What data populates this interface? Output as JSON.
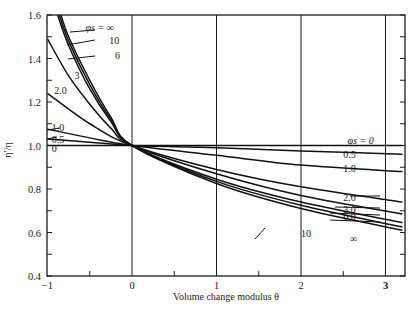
{
  "chart_data": {
    "type": "line",
    "title": "",
    "xlabel": "Volume change modulus θ",
    "ylabel": "η′/η",
    "xlim": [
      -1,
      3.24
    ],
    "ylim": [
      0.4,
      1.6
    ],
    "x_ticks": [
      -1,
      0,
      1,
      2,
      3
    ],
    "x_tick_labels": [
      "−1",
      "0",
      "1",
      "2",
      "3"
    ],
    "y_ticks": [
      0.4,
      0.6,
      0.8,
      1.0,
      1.2,
      1.4,
      1.6
    ],
    "y_tick_labels": [
      "0.4",
      "0.6",
      "0.8",
      "1.0",
      "1.2",
      "1.4",
      "1.6"
    ],
    "vertical_gridlines": [
      0,
      1,
      2,
      3
    ],
    "horizontal_gridlines": [
      1.0
    ],
    "legend_title": "φs",
    "series": [
      {
        "name": "0",
        "label": "0",
        "x": [
          -1,
          0,
          3.2
        ],
        "y": [
          1.0,
          1.0,
          1.0
        ]
      },
      {
        "name": "0.5",
        "label": "0.5",
        "x": [
          -1,
          -0.5,
          0,
          1,
          2,
          3.2
        ],
        "y": [
          1.03,
          1.015,
          1.0,
          0.99,
          0.975,
          0.96
        ]
      },
      {
        "name": "1.0",
        "label": "1.0",
        "x": [
          -1,
          -0.5,
          0,
          1,
          2,
          3.2
        ],
        "y": [
          1.075,
          1.035,
          1.0,
          0.955,
          0.91,
          0.88
        ]
      },
      {
        "name": "2.0",
        "label": "2.0",
        "x": [
          -1,
          -0.5,
          0,
          1,
          2,
          3.2
        ],
        "y": [
          1.24,
          1.1,
          1.0,
          0.89,
          0.81,
          0.74
        ]
      },
      {
        "name": "3.0",
        "label": "3",
        "x": [
          -1,
          -0.75,
          -0.5,
          -0.25,
          0,
          1,
          2,
          3.2
        ],
        "y": [
          1.49,
          1.32,
          1.19,
          1.08,
          1.0,
          0.87,
          0.77,
          0.685
        ]
      },
      {
        "name": "6.0",
        "label": "6",
        "x": [
          -0.88,
          -0.75,
          -0.5,
          -0.25,
          0,
          1,
          2,
          3.2
        ],
        "y": [
          1.6,
          1.46,
          1.26,
          1.11,
          1.0,
          0.845,
          0.74,
          0.645
        ]
      },
      {
        "name": "10",
        "label": "10",
        "x": [
          -0.86,
          -0.75,
          -0.5,
          -0.25,
          0,
          1,
          2,
          3.2
        ],
        "y": [
          1.6,
          1.48,
          1.28,
          1.12,
          1.0,
          0.835,
          0.725,
          0.625
        ]
      },
      {
        "name": "∞",
        "label": "φs = ∞",
        "x": [
          -0.84,
          -0.75,
          -0.5,
          -0.25,
          0,
          1,
          2,
          3.2
        ],
        "y": [
          1.6,
          1.5,
          1.3,
          1.13,
          1.0,
          0.825,
          0.71,
          0.61
        ]
      }
    ],
    "annotations": [
      {
        "text": "φs = ∞",
        "x": -0.55,
        "y": 1.54
      },
      {
        "text": "10",
        "x": -0.27,
        "y": 1.48
      },
      {
        "text": "6",
        "x": -0.2,
        "y": 1.41
      },
      {
        "text": "3",
        "x": -0.68,
        "y": 1.32
      },
      {
        "text": "2.0",
        "x": -0.92,
        "y": 1.25
      },
      {
        "text": "1.0",
        "x": -0.95,
        "y": 1.08
      },
      {
        "text": "0.5",
        "x": -0.95,
        "y": 1.025
      },
      {
        "text": "0",
        "x": -0.95,
        "y": 0.985
      },
      {
        "text": "φs = 0",
        "x": 2.55,
        "y": 1.02
      },
      {
        "text": "0.5",
        "x": 2.5,
        "y": 0.955
      },
      {
        "text": "1.0",
        "x": 2.5,
        "y": 0.89
      },
      {
        "text": "2.0",
        "x": 2.5,
        "y": 0.76
      },
      {
        "text": "3.0",
        "x": 2.5,
        "y": 0.705
      },
      {
        "text": "6.0",
        "x": 2.5,
        "y": 0.67
      },
      {
        "text": "10",
        "x": 2.0,
        "y": 0.595
      },
      {
        "text": "∞",
        "x": 2.58,
        "y": 0.57
      }
    ],
    "grid": false,
    "legend_position": "inline labels"
  }
}
